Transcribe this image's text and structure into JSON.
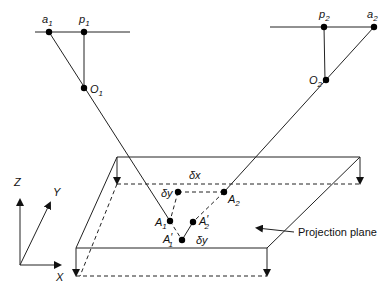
{
  "diagram": {
    "camera1": {
      "image_point_label": "a",
      "image_point_sub": "1",
      "principal_point_label": "p",
      "principal_point_sub": "1",
      "center_label": "O",
      "center_sub": "1"
    },
    "camera2": {
      "principal_point_label": "p",
      "principal_point_sub": "2",
      "image_point_label": "a",
      "image_point_sub": "2",
      "center_label": "O",
      "center_sub": "2"
    },
    "plane_points": {
      "A1": {
        "label": "A",
        "sub": "1"
      },
      "A2": {
        "label": "A",
        "sub": "2"
      },
      "A1p": {
        "label": "A",
        "sub": "1",
        "prime": "′"
      },
      "A2p": {
        "label": "A",
        "sub": "2",
        "prime": "′"
      }
    },
    "parallax": {
      "dx": "δx",
      "dy_top": "δy",
      "dy_bottom": "δy"
    },
    "axes": {
      "z": "Z",
      "y": "Y",
      "x": "X"
    },
    "plane_label": "Projection plane"
  }
}
